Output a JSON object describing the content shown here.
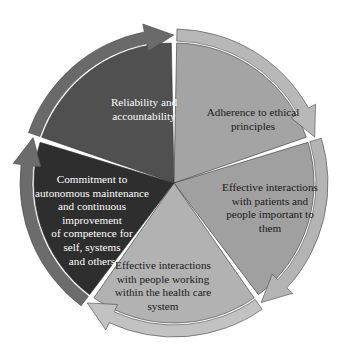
{
  "diagram": {
    "type": "cycle",
    "center": [
      174,
      183
    ],
    "segments": [
      {
        "id": "reliability",
        "lines": [
          "Reliability and",
          "accountability"
        ],
        "fill": "#505050",
        "arrow_fill": "#6a6a6a",
        "text_color": "#ffffff",
        "label_pos": [
          70,
          96,
          148
        ]
      },
      {
        "id": "ethics",
        "lines": [
          "Adherence to ethical",
          "principles"
        ],
        "fill": "#a4a4a4",
        "arrow_fill": "#b8b8b8",
        "text_color": "#1a1a1a",
        "label_pos": [
          188,
          106,
          130
        ]
      },
      {
        "id": "patients",
        "lines": [
          "Effective interactions",
          "with patients and",
          "people important to",
          "them"
        ],
        "fill": "#a0a0a0",
        "arrow_fill": "#b4b4b4",
        "text_color": "#1a1a1a",
        "label_pos": [
          205,
          181,
          130
        ]
      },
      {
        "id": "healthcare",
        "lines": [
          "Effective interactions",
          "with people working",
          "within the health care",
          "system"
        ],
        "fill": "#b2b2b2",
        "arrow_fill": "#c2c2c2",
        "text_color": "#1a1a1a",
        "label_pos": [
          98,
          259,
          130
        ]
      },
      {
        "id": "commitment",
        "lines": [
          "Commitment to",
          "autonomous maintenance",
          "and continuous",
          "improvement",
          "of competence for",
          "self, systems",
          "and others"
        ],
        "fill": "#2e2e2e",
        "arrow_fill": "#6c6c6c",
        "text_color": "#ffffff",
        "label_pos": [
          22,
          173,
          140
        ]
      }
    ]
  }
}
